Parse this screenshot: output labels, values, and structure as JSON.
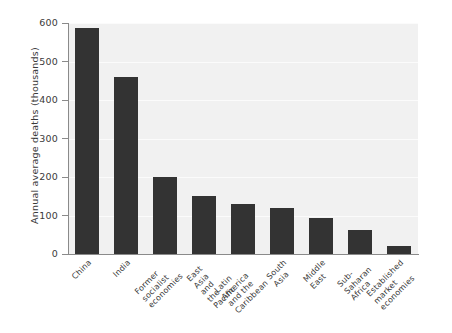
{
  "chart_data": {
    "type": "bar",
    "title": "",
    "xlabel": "",
    "ylabel": "Annual average deaths (thousands)",
    "ylim": [
      0,
      600
    ],
    "yticks": [
      0,
      100,
      200,
      300,
      400,
      500,
      600
    ],
    "ytick_labels": [
      "0",
      "100",
      "200",
      "300",
      "400",
      "500",
      "600"
    ],
    "grid": true,
    "legend": "none",
    "bar_color": "#333333",
    "plot_background": "#f1f1f1",
    "figure_background": "#ffffff",
    "categories": [
      "China",
      "India",
      "Former socialist\neconomies",
      "East Asia\nand the Pacific",
      "Latin America\nand the Caribbean",
      "South Asia",
      "Middle East",
      "Sub-Saharan Africa",
      "Established\nmarket economies"
    ],
    "values": [
      588,
      460,
      200,
      150,
      130,
      120,
      93,
      63,
      22
    ]
  }
}
